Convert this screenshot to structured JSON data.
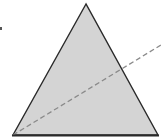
{
  "diagram": {
    "shape": "triangle",
    "fill": "#d4d4d4",
    "stroke": "#2a2a2a",
    "dash_color": "#8a8a8a",
    "vertices": {
      "apex": [
        86,
        4
      ],
      "bottom_left": [
        13,
        135
      ],
      "bottom_right": [
        158,
        135
      ]
    },
    "dashed_line": {
      "from": [
        13,
        135
      ],
      "to": [
        161,
        45
      ]
    },
    "mark": [
      1,
      28
    ]
  }
}
